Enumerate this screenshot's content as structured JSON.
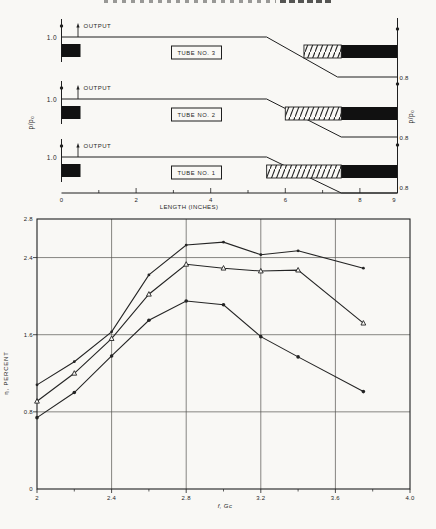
{
  "page": {
    "background": "#f9f8f5",
    "ink": "#1f1f1f"
  },
  "diagram": {
    "left_axis_label": "p/p₀",
    "right_axis_label": "p/p₀",
    "output_label": "OUTPUT",
    "start_pressure_label": "1.0",
    "end_pressure_label": "0.8",
    "x_axis": {
      "label": "LENGTH (INCHES)",
      "tick_labels": [
        "0",
        "2",
        "4",
        "6",
        "8",
        "9"
      ],
      "tick_values": [
        0,
        2,
        4,
        6,
        8,
        9
      ]
    },
    "tubes": [
      {
        "label": "TUBE NO. 3",
        "output_label": "OUTPUT",
        "start_pressure": "1.0",
        "end_pressure": "0.8",
        "drop_start_in": 5.5,
        "drop_end_in": 7.4,
        "hatch_start_in": 6.5,
        "hatch_end_in": 7.5,
        "solid_end_in": 9.0
      },
      {
        "label": "TUBE NO. 2",
        "output_label": "OUTPUT",
        "start_pressure": "1.0",
        "end_pressure": "0.8",
        "drop_start_in": 5.5,
        "drop_end_in": 7.5,
        "hatch_start_in": 6.0,
        "hatch_end_in": 7.5,
        "solid_end_in": 9.0
      },
      {
        "label": "TUBE NO. 1",
        "output_label": "OUTPUT",
        "start_pressure": "1.0",
        "end_pressure": "0.8",
        "drop_start_in": 5.5,
        "drop_end_in": 7.5,
        "hatch_start_in": 5.5,
        "hatch_end_in": 7.5,
        "solid_end_in": 9.0
      }
    ]
  },
  "chart_data": {
    "type": "line",
    "title": "",
    "xlabel": "f, Gc",
    "ylabel": "η, PERCENT",
    "xlim": [
      2.0,
      4.0
    ],
    "ylim": [
      0,
      2.8
    ],
    "x_tick_values": [
      2.0,
      2.4,
      2.8,
      3.2,
      3.6,
      4.0
    ],
    "x_tick_labels": [
      "2",
      "2.4",
      "2.8",
      "3.2",
      "3.6",
      "4.0"
    ],
    "x_minor_ticks": [
      2.2,
      2.6,
      3.0,
      3.4,
      3.8
    ],
    "y_tick_values": [
      0,
      0.8,
      1.6,
      2.4,
      2.8
    ],
    "y_tick_labels": [
      "0",
      "0.8",
      "1.6",
      "2.4",
      "2.8"
    ],
    "grid_x": [
      2.4,
      2.8,
      3.2,
      3.6
    ],
    "grid_y": [
      0.8,
      1.6,
      2.4
    ],
    "grid": true,
    "legend_position": "lower-center-inside",
    "x": [
      2.0,
      2.2,
      2.4,
      2.6,
      2.8,
      3.0,
      3.2,
      3.4,
      3.75
    ],
    "series": [
      {
        "name": "TUBE NO. 3",
        "marker": "dot-small",
        "values": [
          1.08,
          1.32,
          1.63,
          2.22,
          2.53,
          2.56,
          2.43,
          2.47,
          2.29
        ]
      },
      {
        "name": "TUBE NO. 2",
        "marker": "triangle-open",
        "values": [
          0.91,
          1.2,
          1.56,
          2.02,
          2.33,
          2.29,
          2.26,
          2.27,
          1.72
        ]
      },
      {
        "name": "TUBE NO. 1",
        "marker": "dot",
        "values": [
          0.74,
          1.0,
          1.38,
          1.75,
          1.95,
          1.91,
          1.58,
          1.37,
          1.01
        ]
      }
    ],
    "legend": [
      {
        "glyph": "○",
        "text": "= TUBE NO. 3"
      },
      {
        "glyph": "△",
        "text": "= TUBE NO. 2"
      },
      {
        "glyph": "●",
        "text": "= TUBE NO. 1"
      }
    ]
  }
}
